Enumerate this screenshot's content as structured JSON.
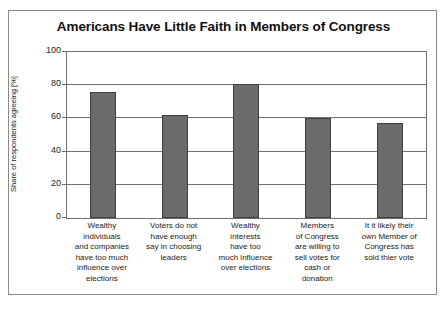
{
  "chart_data": {
    "type": "bar",
    "title": "Americans Have Little Faith in Members of Congress",
    "xlabel": "",
    "ylabel": "Share of respondents agreeing [%]",
    "ylim": [
      0,
      100
    ],
    "yticks": [
      0,
      20,
      40,
      60,
      80,
      100
    ],
    "grid": true,
    "legend": null,
    "categories": [
      "Wealthy individuals and companies have too much influence over elections",
      "Voters do not have enough say in choosing leaders",
      "Wealthy interests have too much influence over elections",
      "Members of Congress are willing to sell votes for cash or donation",
      "It it likely their own Member of Congress has sold thier vote"
    ],
    "category_lines": [
      [
        "Wealthy",
        "individuals",
        "and companies",
        "have too much",
        "influence over",
        "elections"
      ],
      [
        "Voters do not",
        "have enough",
        "say in choosing",
        "leaders"
      ],
      [
        "Wealthy",
        "interests",
        "have too",
        "much influence",
        "over elections"
      ],
      [
        "Members",
        "of Congress",
        "are willing to",
        "sell votes for",
        "cash or",
        "donation"
      ],
      [
        "It it likely their",
        "own Member of",
        "Congress has",
        "sold thier vote"
      ]
    ],
    "values": [
      76,
      62,
      81,
      60,
      57
    ],
    "colors": {
      "bar_fill": "#6b6b6b",
      "bar_edge": "#3f3f3f",
      "gridline": "#707070",
      "axis": "#6f6f6f",
      "frame": "#8a8a8a",
      "background": "#ffffff",
      "text": "#1a1a1a"
    }
  }
}
